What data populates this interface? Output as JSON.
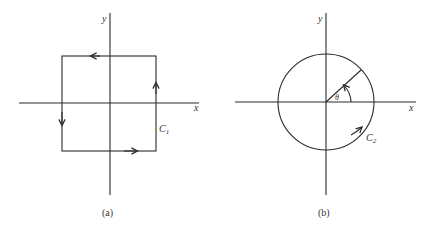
{
  "figure_a": {
    "caption": "(a)",
    "x_axis_label": "x",
    "y_axis_label": "y",
    "curve_label": "C",
    "curve_subscript": "1",
    "shape": "square",
    "orientation": "counterclockwise"
  },
  "figure_b": {
    "caption": "(b)",
    "x_axis_label": "x",
    "y_axis_label": "y",
    "curve_label": "C",
    "curve_subscript": "2",
    "angle_label": "θ",
    "shape": "circle",
    "orientation": "counterclockwise"
  },
  "colors": {
    "stroke": "#2a2a2a",
    "background": "#ffffff"
  }
}
